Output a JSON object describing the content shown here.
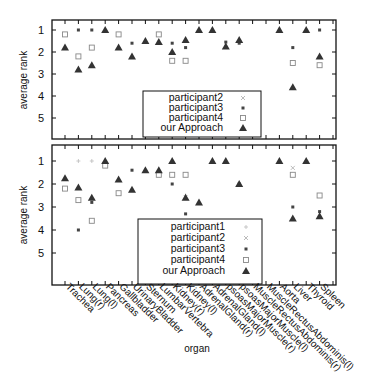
{
  "chart_data": [
    {
      "type": "scatter",
      "panel": "top",
      "ylabel": "average rank",
      "y_ticks": [
        "1",
        "2",
        "3",
        "4",
        "5"
      ],
      "y_inverted": true,
      "ylim": [
        0.6,
        6.0
      ],
      "legend": [
        "participant2",
        "participant3",
        "participant4",
        "our Approach"
      ],
      "categories": [
        "Trachea",
        "Lung(r)",
        "Lung(l)",
        "Pancreas",
        "Gallbladder",
        "UrinaryBladder",
        "Sternum",
        "LumbarVertebra",
        "Kidney(r)",
        "Kidney(l)",
        "AdrenalGland(r)",
        "AdrenalGland(l)",
        "psoasMajorMuscle(r)",
        "psoasMajorMuscle(l)",
        "MuscleRectusAbdominis(r)",
        "MuscleRectusAbdominis(l)",
        "Aorta",
        "Liver",
        "Thyroid",
        "Spleen"
      ],
      "series": [
        {
          "name": "participant2",
          "values": [
            null,
            null,
            null,
            null,
            null,
            null,
            null,
            null,
            null,
            null,
            null,
            null,
            null,
            null,
            null,
            null,
            null,
            null,
            null,
            null
          ]
        },
        {
          "name": "participant3",
          "values": [
            null,
            1.0,
            1.0,
            null,
            null,
            1.6,
            null,
            null,
            1.6,
            1.8,
            null,
            null,
            1.55,
            1.6,
            null,
            null,
            null,
            1.8,
            null,
            1.0
          ]
        },
        {
          "name": "participant4",
          "values": [
            1.2,
            2.2,
            1.8,
            null,
            1.2,
            null,
            null,
            1.2,
            2.4,
            2.4,
            null,
            null,
            null,
            null,
            null,
            null,
            null,
            2.5,
            null,
            2.6
          ]
        },
        {
          "name": "our Approach",
          "values": [
            1.8,
            2.8,
            2.6,
            1.0,
            1.8,
            2.2,
            1.5,
            1.55,
            2.0,
            1.45,
            1.0,
            1.0,
            1.75,
            1.45,
            null,
            null,
            1.0,
            3.6,
            1.0,
            2.2
          ]
        }
      ]
    },
    {
      "type": "scatter",
      "panel": "bottom",
      "xlabel": "organ",
      "ylabel": "average rank",
      "y_ticks": [
        "1",
        "2",
        "3",
        "4",
        "5"
      ],
      "y_inverted": true,
      "ylim": [
        0.6,
        6.0
      ],
      "legend": [
        "participant1",
        "participant2",
        "participant3",
        "participant4",
        "our Approach"
      ],
      "categories": [
        "Trachea",
        "Lung(r)",
        "Lung(l)",
        "Pancreas",
        "Gallbladder",
        "UrinaryBladder",
        "Sternum",
        "LumbarVertebra",
        "Kidney(r)",
        "Kidney(l)",
        "AdrenalGland(r)",
        "AdrenalGland(l)",
        "psoasMajorMuscle(r)",
        "psoasMajorMuscle(l)",
        "MuscleRectusAbdominis(r)",
        "MuscleRectusAbdominis(l)",
        "Aorta",
        "Liver",
        "Thyroid",
        "Spleen"
      ],
      "series": [
        {
          "name": "participant1",
          "values": [
            null,
            1.0,
            1.0,
            null,
            null,
            null,
            null,
            null,
            null,
            2.5,
            null,
            null,
            null,
            null,
            null,
            null,
            null,
            null,
            1.0,
            null
          ]
        },
        {
          "name": "participant2",
          "values": [
            null,
            null,
            null,
            null,
            null,
            null,
            null,
            null,
            null,
            null,
            null,
            null,
            null,
            null,
            null,
            null,
            null,
            1.3,
            null,
            null
          ]
        },
        {
          "name": "participant3",
          "values": [
            null,
            4.0,
            2.8,
            null,
            null,
            1.4,
            null,
            null,
            2.0,
            3.3,
            null,
            null,
            null,
            2.0,
            null,
            null,
            null,
            3.0,
            null,
            3.2
          ]
        },
        {
          "name": "participant4",
          "values": [
            2.2,
            2.7,
            3.6,
            1.2,
            2.4,
            null,
            null,
            1.6,
            1.6,
            1.6,
            null,
            null,
            null,
            null,
            null,
            null,
            null,
            1.6,
            null,
            2.5
          ]
        },
        {
          "name": "our Approach",
          "values": [
            1.75,
            2.15,
            2.6,
            1.0,
            1.8,
            2.25,
            1.4,
            1.4,
            1.0,
            2.6,
            2.8,
            1.0,
            1.0,
            2.0,
            null,
            null,
            1.0,
            3.5,
            1.0,
            3.4
          ]
        }
      ]
    }
  ],
  "labels": {
    "ylabel": "average rank",
    "xlabel": "organ",
    "y_ticks": [
      "1",
      "2",
      "3",
      "4",
      "5"
    ],
    "legend_top": [
      "participant2",
      "participant3",
      "participant4",
      "our Approach"
    ],
    "legend_bottom": [
      "participant1",
      "participant2",
      "participant3",
      "participant4",
      "our Approach"
    ],
    "organs": [
      "Trachea",
      "Lung(r)",
      "Lung(l)",
      "Pancreas",
      "Gallbladder",
      "UrinaryBladder",
      "Sternum",
      "LumbarVertebra",
      "Kidney(r)",
      "Kidney(l)",
      "AdrenalGland(r)",
      "AdrenalGland(l)",
      "psoasMajorMuscle(r)",
      "psoasMajorMuscle(l)",
      "MuscleRectusAbdominis(r)",
      "MuscleRectusAbdominis(l)",
      "Aorta",
      "Liver",
      "Thyroid",
      "Spleen"
    ]
  },
  "colors": {
    "axis": "#111111",
    "approach": "#333333",
    "participant3": "#444444",
    "participant4": "#888888",
    "participant1": "#bbbbbb",
    "participant2": "#aaaaaa"
  }
}
